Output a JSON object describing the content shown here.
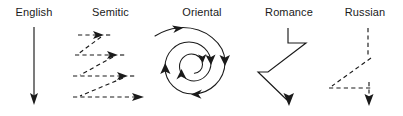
{
  "figure": {
    "background_color": "#ffffff",
    "ink_color": "#1a1a1a",
    "width": 403,
    "height": 116
  },
  "panels": [
    {
      "id": "english",
      "label": "English",
      "pattern": "straight-vertical-arrow",
      "line_style": "solid",
      "description": "A single straight vertical line with a downward arrowhead at the bottom."
    },
    {
      "id": "semitic",
      "label": "Semitic",
      "pattern": "parallel-zigzag-arrows",
      "line_style": "dashed",
      "description": "Four dashed horizontal segments, each ending in a rightward arrowhead, connected by dashed diagonals that step down and back to the left; each successive row is longer."
    },
    {
      "id": "oriental",
      "label": "Oriental",
      "pattern": "inward-spiral",
      "line_style": "solid",
      "description": "A spiral starting outside at the upper left and circling clockwise inward, with arrowheads placed along the turns."
    },
    {
      "id": "romance",
      "label": "Romance",
      "pattern": "digressive-zigzag",
      "line_style": "solid",
      "description": "A solid line that drops, juts right, cuts back diagonally down-left, runs left, then angles down-right to a downward arrowhead."
    },
    {
      "id": "russian",
      "label": "Russian",
      "pattern": "broken-digressive-path",
      "line_style": "dashed",
      "description": "A dashed vertical segment, a dashed diagonal down to the left, a dashed horizontal run to the right, then a short dashed drop to a downward arrowhead."
    }
  ]
}
